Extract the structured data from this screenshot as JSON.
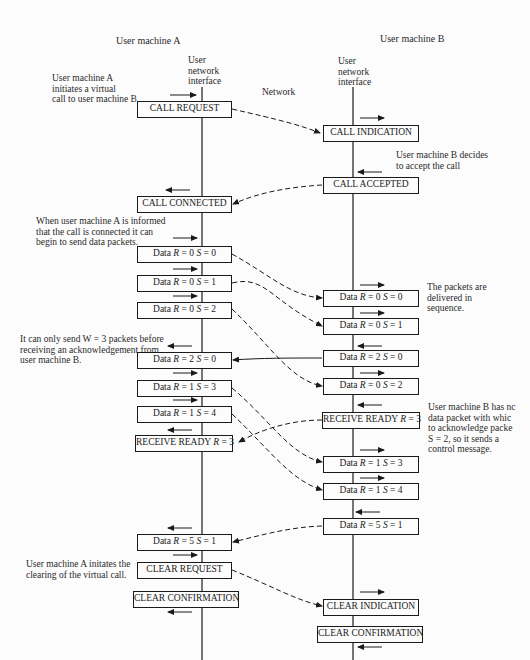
{
  "headers": {
    "machine_a": "User machine A",
    "machine_b": "User machine B",
    "interface_a": "User\nnetwork\ninterface",
    "interface_b": "User\nnetwork\ninterface",
    "network": "Network"
  },
  "annotations": {
    "a_initiates": "User machine A\ninitiates a virtual\ncall to user machine B",
    "b_decides": "User machine B decides\nto accept the call",
    "a_informed": "When user machine A is informed\nthat the call is connected it can\nbegin to send data packets.",
    "in_sequence": "The packets are\ndelivered in\nsequence.",
    "window": "It can only send W = 3 packets before\nreceiving an acknowledgement from\nuser machine B.",
    "b_no_data": "User machine B has nc\ndata packet with whic\nto acknowledge packe\nS = 2, so it sends a\ncontrol message.",
    "a_clearing": "User machine A initates the\nclearing of the virtual call."
  },
  "left_boxes": [
    {
      "id": "call-request",
      "label": "CALL REQUEST"
    },
    {
      "id": "call-connected",
      "label": "CALL CONNECTED"
    },
    {
      "id": "data-a-r0-s0",
      "pre": "Data ",
      "r": "R",
      "rv": " = 0  ",
      "s": "S",
      "sv": " = 0"
    },
    {
      "id": "data-a-r0-s1",
      "pre": "Data ",
      "r": "R",
      "rv": " = 0  ",
      "s": "S",
      "sv": " = 1"
    },
    {
      "id": "data-a-r0-s2",
      "pre": "Data ",
      "r": "R",
      "rv": " = 0  ",
      "s": "S",
      "sv": " = 2"
    },
    {
      "id": "data-a-r2-s0",
      "pre": "Data ",
      "r": "R",
      "rv": " = 2  ",
      "s": "S",
      "sv": " = 0"
    },
    {
      "id": "data-a-r1-s3",
      "pre": "Data ",
      "r": "R",
      "rv": " = 1  ",
      "s": "S",
      "sv": " = 3"
    },
    {
      "id": "data-a-r1-s4",
      "pre": "Data ",
      "r": "R",
      "rv": " = 1  ",
      "s": "S",
      "sv": " = 4"
    },
    {
      "id": "receive-ready-a",
      "pre": "RECEIVE READY ",
      "r": "R",
      "rv": " = 3",
      "s": "",
      "sv": ""
    },
    {
      "id": "data-a-r5-s1",
      "pre": "Data ",
      "r": "R",
      "rv": " = 5  ",
      "s": "S",
      "sv": " = 1"
    },
    {
      "id": "clear-request",
      "label": "CLEAR REQUEST"
    },
    {
      "id": "clear-confirmation-a",
      "label": "CLEAR CONFIRMATION"
    }
  ],
  "right_boxes": [
    {
      "id": "call-indication",
      "label": "CALL INDICATION"
    },
    {
      "id": "call-accepted",
      "label": "CALL ACCEPTED"
    },
    {
      "id": "data-b-r0-s0",
      "pre": "Data ",
      "r": "R",
      "rv": " = 0  ",
      "s": "S",
      "sv": " = 0"
    },
    {
      "id": "data-b-r0-s1",
      "pre": "Data ",
      "r": "R",
      "rv": " = 0  ",
      "s": "S",
      "sv": " = 1"
    },
    {
      "id": "data-b-r2-s0",
      "pre": "Data ",
      "r": "R",
      "rv": " = 2  ",
      "s": "S",
      "sv": " = 0"
    },
    {
      "id": "data-b-r0-s2",
      "pre": "Data ",
      "r": "R",
      "rv": " = 0  ",
      "s": "S",
      "sv": " = 2"
    },
    {
      "id": "receive-ready-b",
      "pre": "RECEIVE READY ",
      "r": "R",
      "rv": " = 3",
      "s": "",
      "sv": ""
    },
    {
      "id": "data-b-r1-s3",
      "pre": "Data ",
      "r": "R",
      "rv": " = 1  ",
      "s": "S",
      "sv": " = 3"
    },
    {
      "id": "data-b-r1-s4",
      "pre": "Data ",
      "r": "R",
      "rv": " = 1  ",
      "s": "S",
      "sv": " = 4"
    },
    {
      "id": "data-b-r5-s1",
      "pre": "Data  ",
      "r": "R",
      "rv": " = 5  ",
      "s": "S",
      "sv": " = 1"
    },
    {
      "id": "clear-indication",
      "label": "CLEAR INDICATION"
    },
    {
      "id": "clear-confirmation-b",
      "label": "CLEAR CONFIRMATION"
    }
  ],
  "colors": {
    "line": "#1a1a1a",
    "background": "#fcfcfc",
    "text": "#222222"
  }
}
